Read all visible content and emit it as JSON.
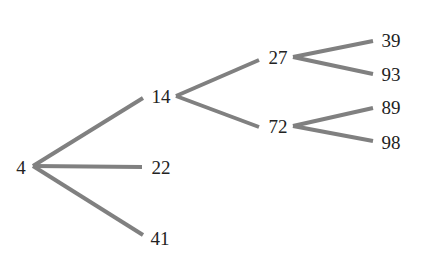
{
  "diagram": {
    "type": "tree",
    "edge_color": "#808080",
    "text_color": "#222222",
    "nodes": [
      {
        "id": "n4",
        "label": "4",
        "x": 21,
        "y": 167
      },
      {
        "id": "n14",
        "label": "14",
        "x": 161,
        "y": 96
      },
      {
        "id": "n22",
        "label": "22",
        "x": 161,
        "y": 167
      },
      {
        "id": "n41",
        "label": "41",
        "x": 160,
        "y": 238
      },
      {
        "id": "n27",
        "label": "27",
        "x": 278,
        "y": 57
      },
      {
        "id": "n72",
        "label": "72",
        "x": 278,
        "y": 126
      },
      {
        "id": "n39",
        "label": "39",
        "x": 391,
        "y": 40
      },
      {
        "id": "n93",
        "label": "93",
        "x": 391,
        "y": 74
      },
      {
        "id": "n89",
        "label": "89",
        "x": 391,
        "y": 107
      },
      {
        "id": "n98",
        "label": "98",
        "x": 391,
        "y": 142
      }
    ],
    "edges": [
      {
        "from": "4",
        "to": "14",
        "x1": 33,
        "y1": 166,
        "x2": 143,
        "y2": 98
      },
      {
        "from": "4",
        "to": "22",
        "x1": 33,
        "y1": 166,
        "x2": 142,
        "y2": 167
      },
      {
        "from": "4",
        "to": "41",
        "x1": 33,
        "y1": 166,
        "x2": 143,
        "y2": 235
      },
      {
        "from": "14",
        "to": "27",
        "x1": 176,
        "y1": 96,
        "x2": 259,
        "y2": 60
      },
      {
        "from": "14",
        "to": "72",
        "x1": 176,
        "y1": 96,
        "x2": 259,
        "y2": 127
      },
      {
        "from": "27",
        "to": "39",
        "x1": 293,
        "y1": 57,
        "x2": 373,
        "y2": 41
      },
      {
        "from": "27",
        "to": "93",
        "x1": 293,
        "y1": 57,
        "x2": 373,
        "y2": 74
      },
      {
        "from": "72",
        "to": "89",
        "x1": 293,
        "y1": 126,
        "x2": 373,
        "y2": 108
      },
      {
        "from": "72",
        "to": "98",
        "x1": 293,
        "y1": 126,
        "x2": 373,
        "y2": 141
      }
    ]
  }
}
